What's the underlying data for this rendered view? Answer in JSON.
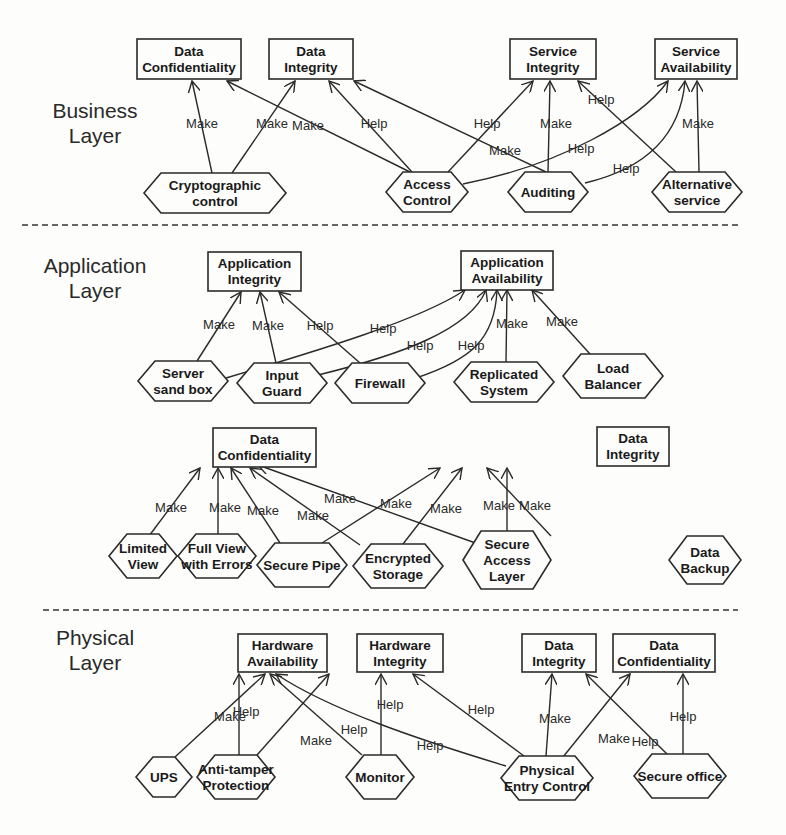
{
  "layers": [
    {
      "id": "business",
      "label_lines": [
        "Business",
        "Layer"
      ],
      "label_pos": [
        95,
        118
      ],
      "goals": [
        {
          "id": "b_dc",
          "lines": [
            "Data",
            "Confidentiality"
          ],
          "x": 137,
          "y": 39,
          "w": 104,
          "h": 40
        },
        {
          "id": "b_di",
          "lines": [
            "Data",
            "Integrity"
          ],
          "x": 269,
          "y": 39,
          "w": 84,
          "h": 40
        },
        {
          "id": "b_si",
          "lines": [
            "Service",
            "Integrity"
          ],
          "x": 510,
          "y": 39,
          "w": 86,
          "h": 40
        },
        {
          "id": "b_sa",
          "lines": [
            "Service",
            "Availability"
          ],
          "x": 655,
          "y": 39,
          "w": 82,
          "h": 40
        }
      ],
      "controls": [
        {
          "id": "b_crypto",
          "lines": [
            "Cryptographic",
            "control"
          ],
          "cx": 215,
          "cy": 193,
          "w": 142,
          "h": 40
        },
        {
          "id": "b_access",
          "lines": [
            "Access",
            "Control"
          ],
          "cx": 427,
          "cy": 192,
          "w": 82,
          "h": 40
        },
        {
          "id": "b_audit",
          "lines": [
            "Auditing"
          ],
          "cx": 548,
          "cy": 192,
          "w": 80,
          "h": 40
        },
        {
          "id": "b_alt",
          "lines": [
            "Alternative",
            "service"
          ],
          "cx": 697,
          "cy": 192,
          "w": 90,
          "h": 40
        }
      ],
      "edges": [
        {
          "from": "b_crypto",
          "to": "b_dc",
          "label": "Make",
          "path": "M212,173 L192,81",
          "lx": 202,
          "ly": 128
        },
        {
          "from": "b_crypto",
          "to": "b_di",
          "label": "Make",
          "path": "M232,173 L295,81",
          "lx": 272,
          "ly": 128
        },
        {
          "from": "b_access",
          "to": "b_dc",
          "label": "Make",
          "path": "M410,172 L227,81",
          "lx": 308,
          "ly": 130
        },
        {
          "from": "b_access",
          "to": "b_di",
          "label": "Help",
          "path": "M412,172 L329,81",
          "lx": 374,
          "ly": 128
        },
        {
          "from": "b_access",
          "to": "b_si",
          "label": "Help",
          "path": "M448,172 L533,81",
          "lx": 487,
          "ly": 128
        },
        {
          "from": "b_access",
          "to": "b_sa",
          "label": "Help",
          "path": "M463,184 C560,165 640,120 668,81",
          "lx": 581,
          "ly": 153
        },
        {
          "from": "b_audit",
          "to": "b_di",
          "label": "Make",
          "path": "M546,172 L354,81",
          "lx": 505,
          "ly": 155
        },
        {
          "from": "b_audit",
          "to": "b_si",
          "label": "Make",
          "path": "M548,172 L550,81",
          "lx": 556,
          "ly": 128
        },
        {
          "from": "b_audit",
          "to": "b_sa",
          "label": "Help",
          "path": "M585,183 C640,170 680,140 685,81",
          "lx": 626,
          "ly": 173
        },
        {
          "from": "b_alt",
          "to": "b_si",
          "label": "Help",
          "path": "M676,172 L578,81",
          "lx": 601,
          "ly": 104
        },
        {
          "from": "b_alt",
          "to": "b_sa",
          "label": "Make",
          "path": "M699,172 L697,81",
          "lx": 698,
          "ly": 128
        }
      ]
    },
    {
      "id": "application",
      "label_lines": [
        "Application",
        "Layer"
      ],
      "label_pos": [
        95,
        273
      ],
      "goals": [
        {
          "id": "a_ai",
          "lines": [
            "Application",
            "Integrity"
          ],
          "x": 208,
          "y": 252,
          "w": 93,
          "h": 39
        },
        {
          "id": "a_aa",
          "lines": [
            "Application",
            "Availability"
          ],
          "x": 461,
          "y": 251,
          "w": 92,
          "h": 39
        },
        {
          "id": "a_dc",
          "lines": [
            "Data",
            "Confidentiality"
          ],
          "x": 213,
          "y": 428,
          "w": 103,
          "h": 39
        },
        {
          "id": "a_di",
          "lines": [
            "Data",
            "Integrity"
          ],
          "x": 597,
          "y": 427,
          "w": 72,
          "h": 39
        }
      ],
      "controls": [
        {
          "id": "a_sandbox",
          "lines": [
            "Server",
            "sand box"
          ],
          "cx": 183,
          "cy": 381,
          "w": 90,
          "h": 40
        },
        {
          "id": "a_input",
          "lines": [
            "Input",
            "Guard"
          ],
          "cx": 282,
          "cy": 383,
          "w": 90,
          "h": 40
        },
        {
          "id": "a_fw",
          "lines": [
            "Firewall"
          ],
          "cx": 380,
          "cy": 383,
          "w": 90,
          "h": 40
        },
        {
          "id": "a_repl",
          "lines": [
            "Replicated",
            "System"
          ],
          "cx": 504,
          "cy": 382,
          "w": 100,
          "h": 40
        },
        {
          "id": "a_lb",
          "lines": [
            "Load",
            "Balancer"
          ],
          "cx": 613,
          "cy": 376,
          "w": 100,
          "h": 44
        },
        {
          "id": "a_limited",
          "lines": [
            "Limited",
            "View"
          ],
          "cx": 143,
          "cy": 556,
          "w": 68,
          "h": 44
        },
        {
          "id": "a_fullview",
          "lines": [
            "Full View",
            "with Errors"
          ],
          "cx": 217,
          "cy": 556,
          "w": 78,
          "h": 44
        },
        {
          "id": "a_pipe",
          "lines": [
            "Secure Pipe"
          ],
          "cx": 302,
          "cy": 565,
          "w": 90,
          "h": 44
        },
        {
          "id": "a_encstore",
          "lines": [
            "Encrypted",
            "Storage"
          ],
          "cx": 398,
          "cy": 566,
          "w": 90,
          "h": 44
        },
        {
          "id": "a_sal",
          "lines": [
            "Secure",
            "Access",
            "Layer"
          ],
          "cx": 507,
          "cy": 560,
          "w": 88,
          "h": 58
        },
        {
          "id": "a_backup",
          "lines": [
            "Data",
            "Backup"
          ],
          "cx": 705,
          "cy": 560,
          "w": 72,
          "h": 48
        }
      ],
      "edges": [
        {
          "from": "a_sandbox",
          "to": "a_ai",
          "label": "Make",
          "path": "M197,361 L241,292",
          "lx": 219,
          "ly": 329
        },
        {
          "from": "a_sandbox",
          "to": "a_aa",
          "label": "Help",
          "path": "M226,378 C320,350 420,320 465,290",
          "lx": 383,
          "ly": 333
        },
        {
          "from": "a_input",
          "to": "a_ai",
          "label": "Make",
          "path": "M276,363 L260,292",
          "lx": 268,
          "ly": 330
        },
        {
          "from": "a_input",
          "to": "a_aa",
          "label": "Help",
          "path": "M318,375 C400,355 470,330 486,290",
          "lx": 420,
          "ly": 350
        },
        {
          "from": "a_fw",
          "to": "a_ai",
          "label": "Help",
          "path": "M360,363 L279,292",
          "lx": 320,
          "ly": 330
        },
        {
          "from": "a_fw",
          "to": "a_aa",
          "label": "Help",
          "path": "M416,378 C470,360 495,340 497,290",
          "lx": 471,
          "ly": 350
        },
        {
          "from": "a_repl",
          "to": "a_aa",
          "label": "Make",
          "path": "M506,362 L507,290",
          "lx": 512,
          "ly": 328
        },
        {
          "from": "a_lb",
          "to": "a_aa",
          "label": "Make",
          "path": "M590,354 L532,290",
          "lx": 562,
          "ly": 326
        },
        {
          "from": "a_limited",
          "to": "a_dc",
          "label": "Make",
          "path": "M149,536 L200,468",
          "lx": 171,
          "ly": 512
        },
        {
          "from": "a_fullview",
          "to": "a_dc",
          "label": "Make",
          "path": "M218,534 L218,468",
          "lx": 225,
          "ly": 512
        },
        {
          "from": "a_pipe",
          "to": "a_dc",
          "label": "Make",
          "path": "M280,543 L231,468",
          "lx": 263,
          "ly": 515
        },
        {
          "from": "a_pipe",
          "to": "a_di",
          "label": "Make",
          "path": "M322,543 L440,468",
          "lx": 396,
          "ly": 508
        },
        {
          "from": "a_encstore",
          "to": "a_dc",
          "label": "Make",
          "path": "M360,545 L250,468",
          "lx": 313,
          "ly": 520
        },
        {
          "from": "a_encstore",
          "to": "a_di",
          "label": "Make",
          "path": "M403,544 L462,468",
          "lx": 446,
          "ly": 513
        },
        {
          "from": "a_sal",
          "to": "a_dc",
          "label": "Make",
          "path": "M481,545 L258,465",
          "lx": 340,
          "ly": 503
        },
        {
          "from": "a_sal",
          "to": "a_di",
          "label": "Make",
          "path": "M507,531 L507,468",
          "lx": 499,
          "ly": 510
        },
        {
          "from": "a_backup",
          "to": "a_di",
          "label": "Make",
          "path": "M551,536 L487,468",
          "lx": 535,
          "ly": 510
        }
      ]
    },
    {
      "id": "physical",
      "label_lines": [
        "Physical",
        "Layer"
      ],
      "label_pos": [
        95,
        645
      ],
      "goals": [
        {
          "id": "p_ha",
          "lines": [
            "Hardware",
            "Availability"
          ],
          "x": 238,
          "y": 634,
          "w": 89,
          "h": 38
        },
        {
          "id": "p_hi",
          "lines": [
            "Hardware",
            "Integrity"
          ],
          "x": 357,
          "y": 634,
          "w": 86,
          "h": 38
        },
        {
          "id": "p_di",
          "lines": [
            "Data",
            "Integrity"
          ],
          "x": 522,
          "y": 634,
          "w": 74,
          "h": 38
        },
        {
          "id": "p_dc",
          "lines": [
            "Data",
            "Confidentiality"
          ],
          "x": 613,
          "y": 634,
          "w": 102,
          "h": 38
        }
      ],
      "controls": [
        {
          "id": "p_ups",
          "lines": [
            "UPS"
          ],
          "cx": 164,
          "cy": 777,
          "w": 56,
          "h": 40
        },
        {
          "id": "p_antitamper",
          "lines": [
            "Anti-tamper",
            "Protection"
          ],
          "cx": 236,
          "cy": 777,
          "w": 78,
          "h": 44
        },
        {
          "id": "p_monitor",
          "lines": [
            "Monitor"
          ],
          "cx": 380,
          "cy": 777,
          "w": 68,
          "h": 44
        },
        {
          "id": "p_entry",
          "lines": [
            "Physical",
            "Entry Control"
          ],
          "cx": 547,
          "cy": 778,
          "w": 92,
          "h": 44
        },
        {
          "id": "p_office",
          "lines": [
            "Secure office"
          ],
          "cx": 680,
          "cy": 776,
          "w": 92,
          "h": 44
        }
      ],
      "edges": [
        {
          "from": "p_ups",
          "to": "p_ha",
          "label": "Make",
          "path": "M175,757 L265,674",
          "lx": 230,
          "ly": 721
        },
        {
          "from": "p_antitamper",
          "to": "p_ha",
          "label": "Help",
          "path": "M239,755 L239,674",
          "lx": 246,
          "ly": 716
        },
        {
          "from": "p_antitamper",
          "to": "p_hi",
          "label": "Make",
          "path": "M257,755 L329,674",
          "lx": 316,
          "ly": 745
        },
        {
          "from": "p_monitor",
          "to": "p_ha",
          "label": "Help",
          "path": "M362,755 L270,674",
          "lx": 354,
          "ly": 734
        },
        {
          "from": "p_monitor",
          "to": "p_hi",
          "label": "Help",
          "path": "M381,755 L381,674",
          "lx": 390,
          "ly": 709
        },
        {
          "from": "p_entry",
          "to": "p_ha",
          "label": "Help",
          "path": "M506,766 C420,740 330,710 276,674",
          "lx": 430,
          "ly": 750
        },
        {
          "from": "p_entry",
          "to": "p_hi",
          "label": "Help",
          "path": "M524,756 L413,674",
          "lx": 481,
          "ly": 714
        },
        {
          "from": "p_entry",
          "to": "p_di",
          "label": "Make",
          "path": "M546,756 L552,674",
          "lx": 555,
          "ly": 723
        },
        {
          "from": "p_entry",
          "to": "p_dc",
          "label": "Make",
          "path": "M563,757 L630,674",
          "lx": 614,
          "ly": 743
        },
        {
          "from": "p_office",
          "to": "p_di",
          "label": "Help",
          "path": "M667,754 L586,674",
          "lx": 645,
          "ly": 746
        },
        {
          "from": "p_office",
          "to": "p_dc",
          "label": "Help",
          "path": "M683,754 L683,674",
          "lx": 683,
          "ly": 721
        }
      ]
    }
  ],
  "dividers": [
    {
      "x1": 22,
      "y1": 225,
      "x2": 738,
      "y2": 225
    },
    {
      "x1": 43,
      "y1": 610,
      "x2": 738,
      "y2": 610
    }
  ],
  "styles": {
    "stroke": "#2a2a2a",
    "background": "#fdfdfb"
  }
}
